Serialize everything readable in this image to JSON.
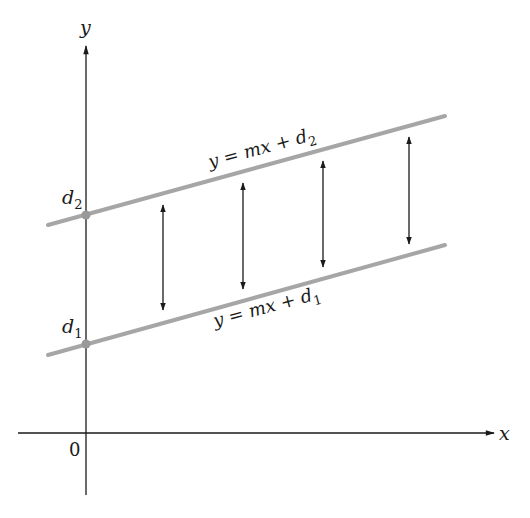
{
  "diagram": {
    "title": "",
    "axes": {
      "x_label": "x",
      "y_label": "y",
      "origin_label": "0"
    },
    "lines": [
      {
        "id": "upper",
        "equation_text": "y = mx + d",
        "subscript": "2",
        "intercept_label": "d",
        "intercept_sub": "2",
        "color": "#a6a6a6"
      },
      {
        "id": "lower",
        "equation_text": "y = mx + d",
        "subscript": "1",
        "intercept_label": "d",
        "intercept_sub": "1",
        "color": "#a6a6a6"
      }
    ],
    "distance_arrows_count": 4,
    "axis_color": "#1a1a1a",
    "arrow_color": "#1a1a1a",
    "intercept_point_color": "#999999"
  }
}
